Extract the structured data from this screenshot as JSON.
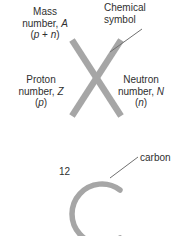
{
  "figure": {
    "background_color": "#ffffff",
    "text_color": "#2f2f2f",
    "glyph_color": "#a0a0a0",
    "leader_line_color": "#6e6e6e"
  },
  "top_panel": {
    "symbol_glyph": "X",
    "mass_number": {
      "line1": "Mass",
      "line2": "number, A",
      "line3": "(p + n)"
    },
    "proton_number": {
      "line1": "Proton",
      "line2": "number, Z",
      "line3": "(p)"
    },
    "neutron_number": {
      "line1": "Neutron",
      "line2": "number, N",
      "line3": "(n)"
    },
    "chemical_symbol": {
      "line1": "Chemical",
      "line2": "symbol"
    }
  },
  "bottom_panel": {
    "symbol_glyph": "C",
    "mass_number_value": "12",
    "element_name": "carbon"
  }
}
